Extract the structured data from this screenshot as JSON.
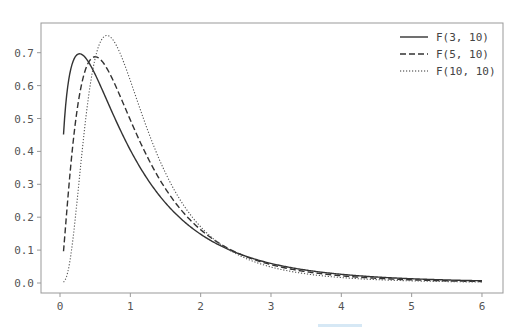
{
  "chart_data": {
    "type": "line",
    "title": "",
    "xlabel": "",
    "ylabel": "",
    "xlim": [
      -0.25,
      6.25
    ],
    "ylim": [
      -0.035,
      0.785
    ],
    "x_ticks": [
      0,
      1,
      2,
      3,
      4,
      5,
      6
    ],
    "x_tick_labels": [
      "0",
      "1",
      "2",
      "3",
      "4",
      "5",
      "6"
    ],
    "y_ticks": [
      0.0,
      0.1,
      0.2,
      0.3,
      0.4,
      0.5,
      0.6,
      0.7
    ],
    "y_tick_labels": [
      "0.0",
      "0.1",
      "0.2",
      "0.3",
      "0.4",
      "0.5",
      "0.6",
      "0.7"
    ],
    "grid": false,
    "legend_position": "upper right",
    "x_range": [
      0.05,
      6.0
    ],
    "series": [
      {
        "name": "F(3, 10)",
        "d1": 3,
        "d2": 10,
        "style": "solid",
        "color": "#333333",
        "sample_points": [
          [
            0.05,
            0.36
          ],
          [
            0.26,
            0.7
          ],
          [
            0.5,
            0.63
          ],
          [
            1.0,
            0.4
          ],
          [
            2.0,
            0.16
          ],
          [
            3.0,
            0.07
          ],
          [
            4.0,
            0.034
          ],
          [
            5.0,
            0.018
          ],
          [
            6.0,
            0.011
          ]
        ]
      },
      {
        "name": "F(5, 10)",
        "d1": 5,
        "d2": 10,
        "style": "dashed",
        "color": "#333333",
        "sample_points": [
          [
            0.05,
            0.05
          ],
          [
            0.3,
            0.55
          ],
          [
            0.5,
            0.68
          ],
          [
            1.0,
            0.5
          ],
          [
            2.0,
            0.16
          ],
          [
            3.0,
            0.06
          ],
          [
            4.0,
            0.027
          ],
          [
            5.0,
            0.014
          ],
          [
            6.0,
            0.008
          ]
        ]
      },
      {
        "name": "F(10, 10)",
        "d1": 10,
        "d2": 10,
        "style": "dotted",
        "color": "#555555",
        "sample_points": [
          [
            0.05,
            0.0
          ],
          [
            0.3,
            0.3
          ],
          [
            0.65,
            0.755
          ],
          [
            1.0,
            0.62
          ],
          [
            2.0,
            0.15
          ],
          [
            3.0,
            0.05
          ],
          [
            4.0,
            0.019
          ],
          [
            5.0,
            0.009
          ],
          [
            6.0,
            0.005
          ]
        ]
      }
    ]
  },
  "legend": {
    "items": [
      {
        "label": "F(3, 10)",
        "style": "solid"
      },
      {
        "label": "F(5, 10)",
        "style": "dashed"
      },
      {
        "label": "F(10, 10)",
        "style": "dotted"
      }
    ]
  },
  "colors": {
    "axes": "#999999",
    "text": "#555555",
    "line": "#333333"
  }
}
